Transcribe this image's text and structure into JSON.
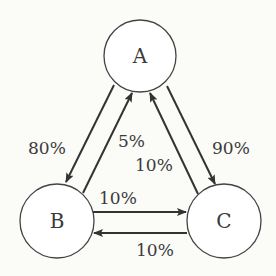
{
  "nodes": [
    {
      "id": "A",
      "label": "A"
    },
    {
      "id": "B",
      "label": "B"
    },
    {
      "id": "C",
      "label": "C"
    }
  ],
  "edges": [
    {
      "from": "A",
      "to": "B",
      "label": "80%"
    },
    {
      "from": "B",
      "to": "A",
      "label": "5%"
    },
    {
      "from": "C",
      "to": "A",
      "label": "10%"
    },
    {
      "from": "A",
      "to": "C",
      "label": "90%"
    },
    {
      "from": "B",
      "to": "C",
      "label": "10%"
    },
    {
      "from": "C",
      "to": "B",
      "label": "10%"
    }
  ],
  "colors": {
    "stroke": "#333333",
    "fill": "#ffffff"
  }
}
